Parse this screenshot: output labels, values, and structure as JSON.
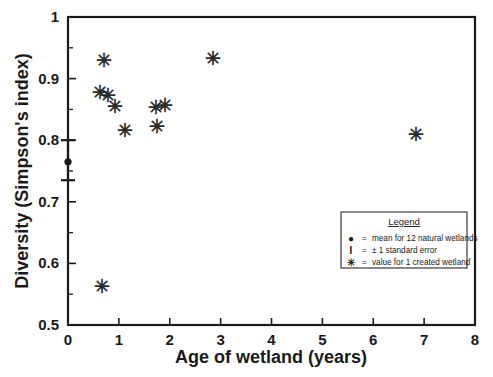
{
  "chart_data": {
    "type": "scatter",
    "title": "",
    "xlabel": "Age of wetland (years)",
    "ylabel": "Diversity (Simpson's index)",
    "xlim": [
      0,
      8
    ],
    "ylim": [
      0.5,
      1
    ],
    "grid": false,
    "xticks": [
      0,
      1,
      2,
      3,
      4,
      5,
      6,
      7,
      8
    ],
    "xticklabels": [
      "0",
      "1",
      "2",
      "3",
      "4",
      "5",
      "6",
      "7",
      "8"
    ],
    "yticks": [
      0.5,
      0.6,
      0.7,
      0.8,
      0.9,
      1
    ],
    "yticklabels": [
      "0.5",
      "0.6",
      "0.7",
      "0.8",
      "0.9",
      "1"
    ],
    "yminorticks": [
      0.55,
      0.65,
      0.75,
      0.85,
      0.95
    ],
    "series": [
      {
        "name": "value for 1 created wetland",
        "marker": "asterisk",
        "points": [
          {
            "x": 0.62,
            "y": 0.878
          },
          {
            "x": 0.66,
            "y": 0.562
          },
          {
            "x": 0.7,
            "y": 0.93
          },
          {
            "x": 0.78,
            "y": 0.872
          },
          {
            "x": 0.92,
            "y": 0.855
          },
          {
            "x": 1.12,
            "y": 0.815
          },
          {
            "x": 1.72,
            "y": 0.853
          },
          {
            "x": 1.75,
            "y": 0.822
          },
          {
            "x": 1.9,
            "y": 0.857
          },
          {
            "x": 2.85,
            "y": 0.933
          },
          {
            "x": 6.85,
            "y": 0.81
          }
        ]
      },
      {
        "name": "mean for 12 natural wetlands",
        "marker": "dot-errorbar",
        "points": [
          {
            "x": 0.0,
            "y": 0.765,
            "err_low": 0.735,
            "err_high": 0.8
          }
        ]
      }
    ]
  },
  "legend": {
    "title": "Legend",
    "position": "inside-lower-right",
    "entries": [
      {
        "symbol": "●",
        "equals": "=",
        "label": "mean for 12 natural wetlands"
      },
      {
        "symbol": "I",
        "equals": "=",
        "label": "± 1 standard error"
      },
      {
        "symbol": "✳",
        "equals": "=",
        "label": "value for 1 created wetland"
      }
    ]
  },
  "colors": {
    "background": "#ffffff",
    "axis": "#1a1a1a",
    "marker": "#2b2b2b",
    "legend_border": "#3a3a3a"
  }
}
